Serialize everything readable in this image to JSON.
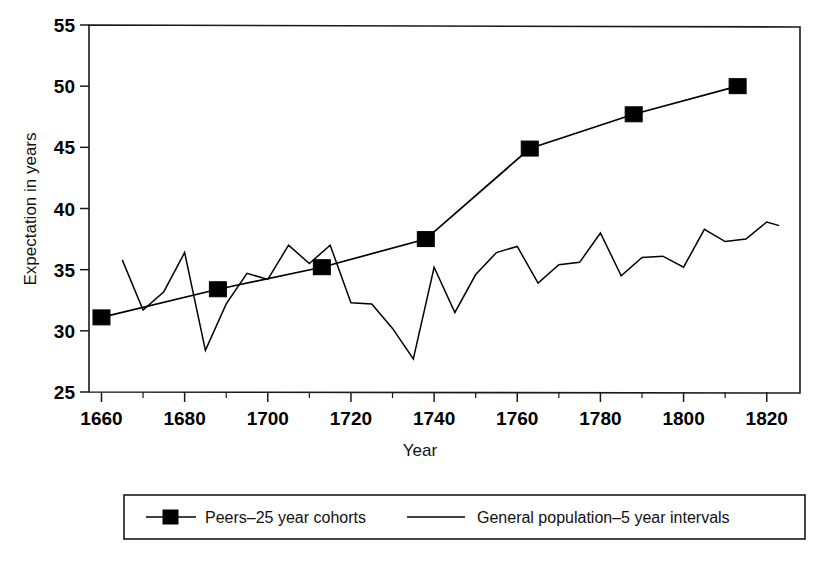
{
  "chart_data": {
    "type": "line",
    "title": "",
    "xlabel": "Year",
    "ylabel": "Expectation in years",
    "xlim": [
      1657,
      1828
    ],
    "ylim": [
      25,
      55
    ],
    "xticks": [
      1660,
      1680,
      1700,
      1720,
      1740,
      1760,
      1780,
      1800,
      1820
    ],
    "xtick_labels": [
      "1660",
      "1680",
      "1700",
      "1720",
      "1740",
      "1760",
      "1780",
      "1800",
      "1820"
    ],
    "xminor_ticks": [
      1670,
      1690,
      1710,
      1730,
      1750,
      1770,
      1790,
      1810
    ],
    "yticks": [
      25,
      30,
      35,
      40,
      45,
      50,
      55
    ],
    "ytick_labels": [
      "25",
      "30",
      "35",
      "40",
      "45",
      "50",
      "55"
    ],
    "grid": false,
    "legend_position": "below",
    "series": [
      {
        "name": "Peers–25 year cohorts",
        "marker": "square",
        "x": [
          1660,
          1688,
          1713,
          1738,
          1763,
          1788,
          1813
        ],
        "values": [
          31.1,
          33.4,
          35.2,
          37.5,
          44.9,
          47.7,
          50.0
        ]
      },
      {
        "name": "General population–5 year intervals",
        "marker": "none",
        "x": [
          1665,
          1670,
          1675,
          1680,
          1685,
          1690,
          1695,
          1700,
          1705,
          1710,
          1715,
          1720,
          1725,
          1730,
          1735,
          1740,
          1745,
          1750,
          1755,
          1760,
          1765,
          1770,
          1775,
          1780,
          1785,
          1790,
          1795,
          1800,
          1805,
          1810,
          1815,
          1820,
          1823
        ],
        "values": [
          35.8,
          31.7,
          33.2,
          36.4,
          28.4,
          32.2,
          34.7,
          34.2,
          37.0,
          35.5,
          37.0,
          32.3,
          32.2,
          30.2,
          27.7,
          35.2,
          31.5,
          34.6,
          36.4,
          36.9,
          33.9,
          35.4,
          35.6,
          38.0,
          34.5,
          36.0,
          36.1,
          35.2,
          38.3,
          37.3,
          37.5,
          38.9,
          38.6
        ]
      }
    ]
  },
  "axes": {
    "ylabel": "Expectation in years",
    "xlabel": "Year"
  },
  "legend": {
    "entries": [
      {
        "label": "Peers–25 year cohorts",
        "style": "line-with-square-marker"
      },
      {
        "label": "General population–5 year intervals",
        "style": "plain-line"
      }
    ]
  },
  "colors": {
    "ink": "#000000",
    "frame": "#1a1a1a",
    "background": "#ffffff"
  }
}
